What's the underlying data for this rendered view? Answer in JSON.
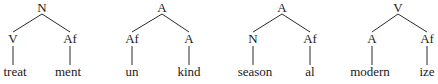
{
  "trees": [
    {
      "root": {
        "label": "N",
        "x": 42,
        "y": 12
      },
      "left": {
        "label": "V",
        "x": 13,
        "y": 43,
        "leaf": "treat",
        "leaf_x": 15
      },
      "right": {
        "label": "Af",
        "x": 70,
        "y": 43,
        "leaf": "ment",
        "leaf_x": 68
      }
    },
    {
      "root": {
        "label": "A",
        "x": 162,
        "y": 12
      },
      "left": {
        "label": "Af",
        "x": 132,
        "y": 43,
        "leaf": "un",
        "leaf_x": 132
      },
      "right": {
        "label": "A",
        "x": 189,
        "y": 43,
        "leaf": "kind",
        "leaf_x": 189
      }
    },
    {
      "root": {
        "label": "A",
        "x": 282,
        "y": 12
      },
      "left": {
        "label": "N",
        "x": 253,
        "y": 43,
        "leaf": "season",
        "leaf_x": 255
      },
      "right": {
        "label": "Af",
        "x": 310,
        "y": 43,
        "leaf": "al",
        "leaf_x": 310
      }
    },
    {
      "root": {
        "label": "V",
        "x": 398,
        "y": 12
      },
      "left": {
        "label": "A",
        "x": 372,
        "y": 43,
        "leaf": "modern",
        "leaf_x": 370
      },
      "right": {
        "label": "Af",
        "x": 427,
        "y": 43,
        "leaf": "ize",
        "leaf_x": 427
      }
    }
  ]
}
